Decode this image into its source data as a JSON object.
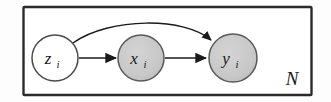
{
  "figure": {
    "kind": "plate-notation-graphical-model",
    "background_color": "#fdfdfd"
  },
  "plate": {
    "label": "N",
    "border_color": "#2b2b2b",
    "fill_color": "#ffffff"
  },
  "nodes": [
    {
      "id": "z",
      "symbol": "z",
      "subscript": "i",
      "shaded": false,
      "fill_color": "#ffffff",
      "stroke_color": "#4a4a4a",
      "cx": 55,
      "cy": 58,
      "r": 23
    },
    {
      "id": "x",
      "symbol": "x",
      "subscript": "i",
      "shaded": true,
      "fill_color": "#c9c9c9",
      "stroke_color": "#5a5a5a",
      "cx": 141,
      "cy": 58,
      "r": 23
    },
    {
      "id": "y",
      "symbol": "y",
      "subscript": "i",
      "shaded": true,
      "fill_color": "#c9c9c9",
      "stroke_color": "#5a5a5a",
      "cx": 233,
      "cy": 58,
      "r": 24
    }
  ],
  "edges": [
    {
      "id": "z-to-x",
      "from": "z",
      "to": "x",
      "style": "straight",
      "color": "#1a1a1a"
    },
    {
      "id": "x-to-y",
      "from": "x",
      "to": "y",
      "style": "straight",
      "color": "#1a1a1a"
    },
    {
      "id": "z-to-y",
      "from": "z",
      "to": "y",
      "style": "curved",
      "color": "#1a1a1a"
    }
  ]
}
